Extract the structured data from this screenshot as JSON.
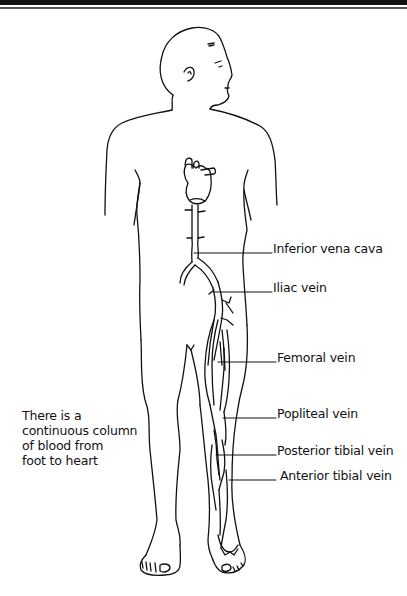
{
  "diagram": {
    "labels": [
      {
        "id": "inferior-vena-cava",
        "text": "Inferior vena cava"
      },
      {
        "id": "iliac-vein",
        "text": "Iliac vein"
      },
      {
        "id": "femoral-vein",
        "text": "Femoral vein"
      },
      {
        "id": "popliteal-vein",
        "text": "Popliteal vein"
      },
      {
        "id": "posterior-tibial-vein",
        "text": "Posterior tibial vein"
      },
      {
        "id": "anterior-tibial-vein",
        "text": "Anterior tibial vein"
      }
    ],
    "note": {
      "lines": [
        "There is a",
        "continuous column",
        "of blood from",
        "foot to heart"
      ]
    },
    "colors": {
      "ink": "#111111",
      "background": "#ffffff"
    }
  }
}
